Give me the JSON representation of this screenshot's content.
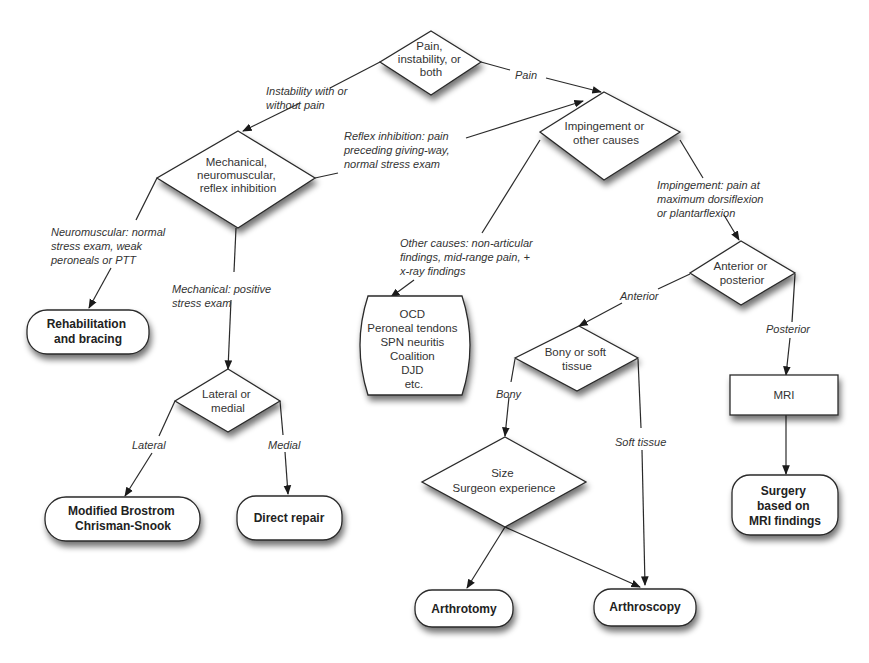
{
  "diagram": {
    "type": "flowchart",
    "decisions": {
      "root": [
        "Pain,",
        "instability, or",
        "both"
      ],
      "mechanical": [
        "Mechanical,",
        "neuromuscular,",
        "reflex inhibition"
      ],
      "impingement": [
        "Impingement or",
        "other causes"
      ],
      "ant_post": [
        "Anterior or",
        "posterior"
      ],
      "lat_med": [
        "Lateral or",
        "medial"
      ],
      "bony_soft": [
        "Bony or soft",
        "tissue"
      ],
      "size": [
        "Size",
        "Surgeon experience"
      ]
    },
    "process": {
      "mri": "MRI"
    },
    "terminals": {
      "rehab": [
        "Rehabilitation",
        "and bracing"
      ],
      "brostrom": [
        "Modified Brostrom",
        "Chrisman-Snook"
      ],
      "direct": [
        "Direct repair"
      ],
      "other_list": [
        "OCD",
        "Peroneal tendons",
        "SPN neuritis",
        "Coalition",
        "DJD",
        "etc."
      ],
      "arthrotomy": [
        "Arthrotomy"
      ],
      "arthroscopy": [
        "Arthroscopy"
      ],
      "surgery_mri": [
        "Surgery",
        "based on",
        "MRI findings"
      ]
    },
    "edges": {
      "instability": [
        "Instability with or",
        "without pain"
      ],
      "pain": [
        "Pain"
      ],
      "reflex": [
        "Reflex inhibition: pain",
        "preceding giving-way,",
        "normal stress exam"
      ],
      "neuromuscular": [
        "Neuromuscular: normal",
        "stress exam, weak",
        "peroneals or PTT"
      ],
      "mechanical": [
        "Mechanical: positive",
        "stress exam"
      ],
      "other_causes": [
        "Other causes: non-articular",
        "findings, mid-range pain, +",
        "x-ray findings"
      ],
      "impingement": [
        "Impingement: pain at",
        "maximum dorsiflexion",
        "or plantarflexion"
      ],
      "anterior": [
        "Anterior"
      ],
      "posterior": [
        "Posterior"
      ],
      "lateral": [
        "Lateral"
      ],
      "medial": [
        "Medial"
      ],
      "bony": [
        "Bony"
      ],
      "soft_tissue": [
        "Soft tissue"
      ]
    }
  }
}
